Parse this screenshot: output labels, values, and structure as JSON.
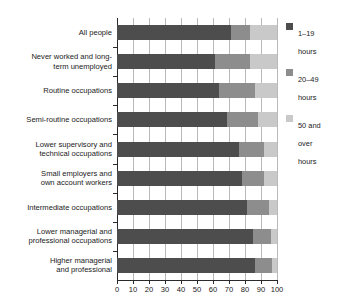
{
  "chart_data": {
    "type": "bar",
    "orientation": "horizontal",
    "stacked": true,
    "percent": true,
    "title": "",
    "xlabel": "",
    "ylabel": "",
    "xlim": [
      0,
      100
    ],
    "xticks": [
      0,
      10,
      20,
      30,
      40,
      50,
      60,
      70,
      80,
      90,
      100
    ],
    "xtick_labels": [
      "0",
      "10",
      "20",
      "30",
      "40",
      "50",
      "60",
      "70",
      "80",
      "90",
      "100"
    ],
    "grid": true,
    "grid_axis": "x",
    "legend_position": "right",
    "categories": [
      "All people",
      "Never worked and long-term unemployed",
      "Routine occupations",
      "Semi-routine occupations",
      "Lower supervisory and technical occupations",
      "Small employers and own account workers",
      "Intermediate occupations",
      "Lower managerial and professional occupations",
      "Higher managerial and professional"
    ],
    "category_lines": [
      [
        "All people"
      ],
      [
        "Never worked and long-",
        "term unemployed"
      ],
      [
        "Routine occupations"
      ],
      [
        "Semi-routine occupations"
      ],
      [
        "Lower supervisory and",
        "technical occupations"
      ],
      [
        "Small employers and",
        "own account workers"
      ],
      [
        "Intermediate occupations"
      ],
      [
        "Lower managerial and",
        "professional occupations"
      ],
      [
        "Higher managerial",
        "and professional"
      ]
    ],
    "series": [
      {
        "name": "1–19 hours",
        "name_lines": [
          "1–19",
          "hours"
        ],
        "color": "#4d4d4d",
        "values": [
          71,
          61,
          64,
          69,
          76,
          78,
          81,
          85,
          86
        ]
      },
      {
        "name": "20–49 hours",
        "name_lines": [
          "20–49",
          "hours"
        ],
        "color": "#8d8d8d",
        "values": [
          12,
          22,
          22,
          19,
          16,
          14,
          14,
          11,
          11
        ]
      },
      {
        "name": "50 and over hours",
        "name_lines": [
          "50 and",
          "over",
          "hours"
        ],
        "color": "#c9c9c9",
        "values": [
          17,
          17,
          14,
          12,
          8,
          8,
          5,
          4,
          3
        ]
      }
    ]
  },
  "legend": {
    "items": [
      {
        "label": "1–19\nhours",
        "color": "#4d4d4d"
      },
      {
        "label": "20–49\nhours",
        "color": "#8d8d8d"
      },
      {
        "label": "50 and\nover\nhours",
        "color": "#c9c9c9"
      }
    ]
  }
}
